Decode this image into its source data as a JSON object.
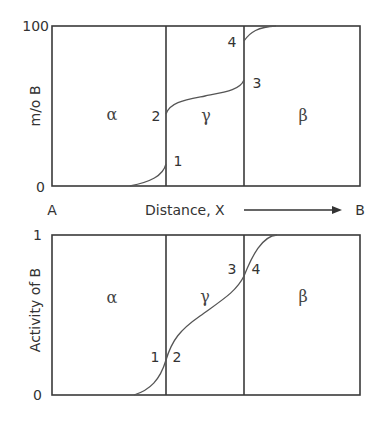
{
  "figure": {
    "top_panel": {
      "y_axis_label": "m/o B",
      "y_tick_max": "100",
      "y_tick_min": "0",
      "phases": {
        "left": "α",
        "middle": "γ",
        "right": "β"
      },
      "points": {
        "p1": "1",
        "p2": "2",
        "p3": "3",
        "p4": "4"
      }
    },
    "x_axis": {
      "left_end": "A",
      "label": "Distance, X",
      "right_end": "B"
    },
    "bottom_panel": {
      "y_axis_label": "Activity of B",
      "y_tick_max": "1",
      "y_tick_min": "0",
      "phases": {
        "left": "α",
        "middle": "γ",
        "right": "β"
      },
      "points": {
        "p1": "1",
        "p2": "2",
        "p3": "3",
        "p4": "4"
      }
    },
    "colors": {
      "frame": "#3a3a3a",
      "curve": "#555555",
      "text": "#333333"
    }
  }
}
